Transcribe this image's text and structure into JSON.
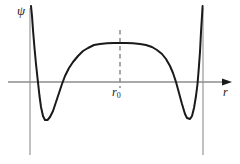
{
  "figure": {
    "kind": "line",
    "background_color": "#ffffff",
    "width": 240,
    "height": 164
  },
  "labels": {
    "y_axis": "ψ",
    "x_axis": "r",
    "marker": "r",
    "marker_subscript": "0"
  },
  "colors": {
    "curve": "#1a1a1a",
    "axis": "#8c8c8c",
    "asymptote": "#a6a6a6",
    "dashed": "#8c8c8c",
    "arrow": "#1a1a1a",
    "text": "#1a1a1a"
  },
  "chart_data": {
    "type": "line",
    "title": "",
    "xlabel": "r",
    "ylabel": "ψ",
    "grid": false,
    "legend": null,
    "xlim": [
      0,
      240
    ],
    "ylim_pixels": [
      164,
      0
    ],
    "axes": {
      "x_axis_y_px": 82,
      "x_axis_x_start_px": 8,
      "x_axis_x_end_px": 232,
      "y_axis_x_px": 30,
      "y_axis_y_start_px": 8,
      "y_axis_y_end_px": 155,
      "arrow_at": "x-axis-right",
      "right_asymptote_x_px": 203,
      "right_asymptote_y_start_px": 8,
      "right_asymptote_y_end_px": 155
    },
    "annotations": [
      {
        "name": "r0-dashed-marker",
        "text": "r₀",
        "x_px": 120,
        "y_top_px": 30,
        "y_bottom_px": 88,
        "style": "dashed-vertical"
      }
    ],
    "series": [
      {
        "name": "psi(r)",
        "color": "#1a1a1a",
        "stroke_width": 2,
        "points_px": [
          [
            31,
            6
          ],
          [
            32,
            16
          ],
          [
            33,
            30
          ],
          [
            34.5,
            48
          ],
          [
            36,
            64
          ],
          [
            37.5,
            78
          ],
          [
            38.4,
            86
          ],
          [
            39.5,
            96
          ],
          [
            41,
            107
          ],
          [
            43,
            116
          ],
          [
            45,
            120
          ],
          [
            47.5,
            120
          ],
          [
            50,
            117
          ],
          [
            53,
            111
          ],
          [
            56,
            102
          ],
          [
            59,
            93
          ],
          [
            62,
            84
          ],
          [
            65,
            76
          ],
          [
            69,
            68
          ],
          [
            73,
            62
          ],
          [
            78,
            56
          ],
          [
            83,
            51
          ],
          [
            88,
            48
          ],
          [
            94,
            45
          ],
          [
            100,
            44
          ],
          [
            107,
            43.3
          ],
          [
            114,
            43
          ],
          [
            120,
            43
          ],
          [
            126,
            43
          ],
          [
            133,
            43.3
          ],
          [
            140,
            44
          ],
          [
            146,
            45
          ],
          [
            152,
            47
          ],
          [
            157,
            50
          ],
          [
            162,
            54
          ],
          [
            166,
            59
          ],
          [
            170,
            66
          ],
          [
            173,
            73
          ],
          [
            176,
            82
          ],
          [
            179,
            93
          ],
          [
            182,
            104
          ],
          [
            185,
            114
          ],
          [
            187,
            118
          ],
          [
            190,
            119
          ],
          [
            192,
            116
          ],
          [
            194,
            108
          ],
          [
            196,
            96
          ],
          [
            197.5,
            84
          ],
          [
            198.5,
            72
          ],
          [
            200,
            52
          ],
          [
            201,
            32
          ],
          [
            202,
            16
          ],
          [
            202.6,
            6
          ]
        ]
      }
    ]
  }
}
